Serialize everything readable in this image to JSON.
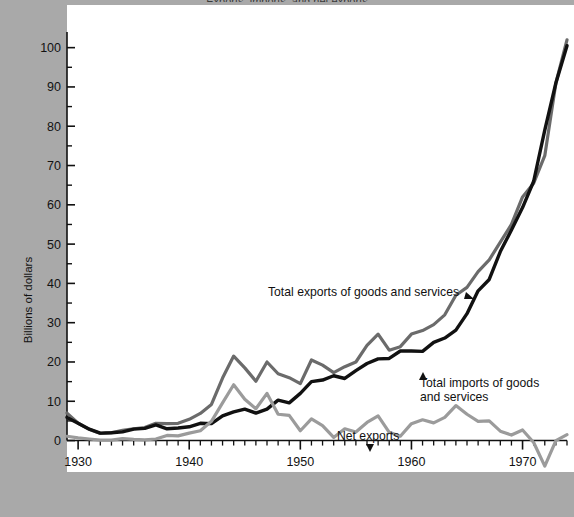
{
  "chart_data": {
    "type": "line",
    "title": "",
    "xlabel": "",
    "ylabel": "Billions of dollars",
    "xlim": [
      1929,
      1974
    ],
    "ylim": [
      -8,
      105
    ],
    "ytick_labels": [
      "0",
      "10",
      "20",
      "30",
      "40",
      "50",
      "60",
      "70",
      "80",
      "90",
      "100"
    ],
    "ytick_values": [
      0,
      10,
      20,
      30,
      40,
      50,
      60,
      70,
      80,
      90,
      100
    ],
    "yminor_values": [
      5,
      15,
      25,
      35,
      45,
      55,
      65,
      75,
      85,
      95
    ],
    "xtick_labels": [
      "1930",
      "1940",
      "1950",
      "1960",
      "1970"
    ],
    "xtick_values": [
      1930,
      1940,
      1950,
      1960,
      1970
    ],
    "grid": false,
    "legend_position": "inline-annotations",
    "x": [
      1929,
      1930,
      1931,
      1932,
      1933,
      1934,
      1935,
      1936,
      1937,
      1938,
      1939,
      1940,
      1941,
      1942,
      1943,
      1944,
      1945,
      1946,
      1947,
      1948,
      1949,
      1950,
      1951,
      1952,
      1953,
      1954,
      1955,
      1956,
      1957,
      1958,
      1959,
      1960,
      1961,
      1962,
      1963,
      1964,
      1965,
      1966,
      1967,
      1968,
      1969,
      1970,
      1971,
      1972,
      1973,
      1974
    ],
    "series": [
      {
        "name": "Total exports of goods and services",
        "color": "#6b6b6b",
        "values": [
          7.0,
          4.4,
          2.9,
          1.8,
          2.0,
          2.6,
          3.0,
          3.3,
          4.4,
          4.3,
          4.4,
          5.4,
          6.9,
          9.2,
          15.9,
          21.5,
          18.5,
          15.1,
          20.0,
          17.0,
          16.0,
          14.5,
          20.5,
          19.2,
          17.3,
          18.8,
          20.0,
          24.2,
          27.1,
          23.0,
          23.9,
          27.1,
          28.0,
          29.5,
          32.0,
          37.0,
          39.0,
          43.0,
          46.0,
          50.5,
          55.0,
          62.0,
          65.5,
          72.5,
          91.0,
          102.0
        ]
      },
      {
        "name": "Total imports of goods and services",
        "color": "#111111",
        "values": [
          5.9,
          4.4,
          2.9,
          1.9,
          2.0,
          2.2,
          2.9,
          3.1,
          4.0,
          3.0,
          3.2,
          3.5,
          4.4,
          4.3,
          6.3,
          7.3,
          8.0,
          7.0,
          8.0,
          10.3,
          9.6,
          12.0,
          15.0,
          15.4,
          16.5,
          15.8,
          17.8,
          19.6,
          20.8,
          20.9,
          22.8,
          22.8,
          22.7,
          25.0,
          26.1,
          28.1,
          32.3,
          38.1,
          41.0,
          48.1,
          53.6,
          59.3,
          66.0,
          79.0,
          91.0,
          100.5
        ]
      },
      {
        "name": "Net exports",
        "color": "#9b9b9b",
        "values": [
          1.1,
          0.7,
          0.4,
          0.1,
          0.1,
          0.5,
          0.3,
          0.2,
          0.4,
          1.3,
          1.2,
          1.9,
          2.5,
          4.9,
          9.6,
          14.2,
          10.5,
          8.1,
          12.0,
          6.7,
          6.4,
          2.5,
          5.5,
          3.8,
          0.8,
          3.0,
          2.2,
          4.6,
          6.3,
          2.1,
          1.1,
          4.3,
          5.3,
          4.5,
          5.9,
          8.9,
          6.7,
          4.9,
          5.0,
          2.4,
          1.4,
          2.7,
          -0.5,
          -6.5,
          0.0,
          1.5
        ]
      }
    ],
    "annotations": [
      {
        "name": "exports-label",
        "text": "Total exports of goods and services",
        "arrow": "right-down"
      },
      {
        "name": "imports-label-line1",
        "text": "Total imports of goods",
        "arrow": "up"
      },
      {
        "name": "imports-label-line2",
        "text": "and services",
        "arrow": "none"
      },
      {
        "name": "net-exports-label",
        "text": "Net exports",
        "arrow": "down"
      }
    ]
  },
  "top_clipped_text": "Exports, imports, and net exports"
}
